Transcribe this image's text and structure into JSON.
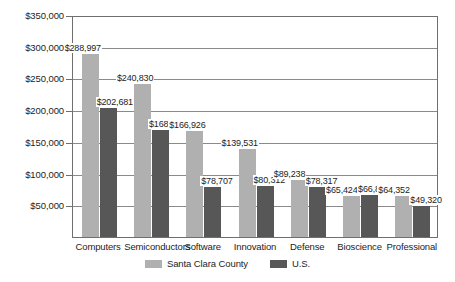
{
  "chart_data": {
    "type": "bar",
    "title": "",
    "xlabel": "",
    "ylabel": "",
    "ylim": [
      0,
      350000
    ],
    "grid": true,
    "legend_position": "bottom-center",
    "categories": [
      "Computers",
      "Semiconductors",
      "Software",
      "Innovation",
      "Defense",
      "Bioscience",
      "Professional"
    ],
    "ytick_labels": [
      "$350,000",
      "$300,000",
      "$250,000",
      "$200,000",
      "$150,000",
      "$100,000",
      "$50,000"
    ],
    "ytick_values": [
      350000,
      300000,
      250000,
      200000,
      150000,
      100000,
      50000
    ],
    "series": [
      {
        "name": "Santa Clara County",
        "color": "#b0b0b0",
        "values": [
          288997,
          240830,
          166926,
          139531,
          89238,
          65424,
          64352
        ],
        "value_labels": [
          "$288,997",
          "$240,830",
          "$166,926",
          "$139,531",
          "$89,238",
          "$65,424",
          "$64,352"
        ]
      },
      {
        "name": "U.S.",
        "color": "#575757",
        "values": [
          202681,
          168503,
          78707,
          80312,
          78317,
          66831,
          49320
        ],
        "value_labels": [
          "$202,681",
          "$168,503",
          "$78,707",
          "$80,312",
          "$78,317",
          "$66,831",
          "$49,320"
        ]
      }
    ]
  },
  "legend": {
    "entries": [
      {
        "label": "Santa Clara County",
        "swatch": "county"
      },
      {
        "label": "U.S.",
        "swatch": "us"
      }
    ]
  },
  "colors": {
    "series_county": "#b0b0b0",
    "series_us": "#575757",
    "axis": "#6f6f6f",
    "gridline": "#8a8a8a",
    "text": "#1d1d1d",
    "background": "#ffffff"
  }
}
